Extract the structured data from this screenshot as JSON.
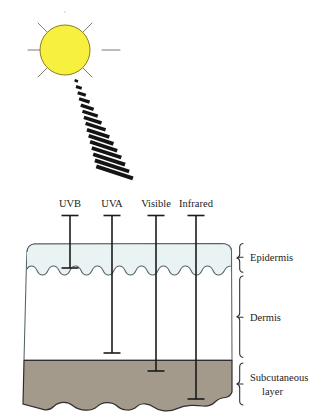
{
  "figure": {
    "background": "#ffffff"
  },
  "sun": {
    "name": "sun",
    "fill": "#F7F03F",
    "stroke": "#8a7c20",
    "center_x": 65,
    "center_y": 50,
    "radius": 25,
    "ray_count": 8
  },
  "beam": {
    "name": "sun-beam",
    "color": "#141414",
    "bar_count": 15,
    "description": "Diagonal dashed ray beam widening downward from the sun"
  },
  "radiation": [
    {
      "label": "UVB",
      "label_x": 70,
      "tick_x": 70,
      "top_y": 215,
      "bottom_y": 268,
      "depth_layer": "Epidermis"
    },
    {
      "label": "UVA",
      "label_x": 112,
      "tick_x": 112,
      "top_y": 215,
      "bottom_y": 353,
      "depth_layer": "Dermis"
    },
    {
      "label": "Visible",
      "label_x": 156,
      "tick_x": 156,
      "top_y": 215,
      "bottom_y": 371,
      "depth_layer": "Subcutaneous layer"
    },
    {
      "label": "Infrared",
      "label_x": 196,
      "tick_x": 196,
      "top_y": 215,
      "bottom_y": 399,
      "depth_layer": "Subcutaneous layer"
    }
  ],
  "layers": [
    {
      "name": "Epidermis",
      "fill": "#eaf3f4",
      "stroke": "#4c5a5e",
      "brace_top": 243,
      "brace_bottom": 272,
      "label_x": 258,
      "label_y": 259
    },
    {
      "name": "Dermis",
      "fill": "#ffffff",
      "stroke": "#4c5a5e",
      "brace_top": 275,
      "brace_bottom": 358,
      "label_x": 258,
      "label_y": 320
    },
    {
      "name": "Subcutaneous",
      "name_line2": "layer",
      "fill": "#a49a8c",
      "stroke": "#2c2c2c",
      "brace_top": 362,
      "brace_bottom": 412,
      "label_x": 258,
      "label_y": 381
    }
  ],
  "skin_block": {
    "left": 22,
    "right": 232,
    "top": 243,
    "bottom": 412,
    "epidermis_bottom": 272,
    "dermis_bottom": 360
  }
}
